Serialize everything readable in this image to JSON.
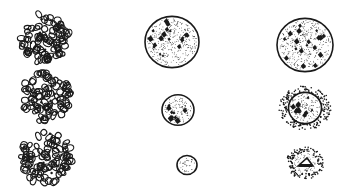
{
  "figure": {
    "type": "scientific-illustration",
    "background": "#ffffff",
    "ink": "#1a1a1a",
    "columns": [
      {
        "name": "reticulated-nuclei",
        "items": [
          {
            "cx": 45,
            "cy": 38,
            "r": 28,
            "style": "reticulate"
          },
          {
            "cx": 46,
            "cy": 97,
            "r": 28,
            "style": "reticulate"
          },
          {
            "cx": 46,
            "cy": 158,
            "r": 29,
            "style": "reticulate"
          }
        ]
      },
      {
        "name": "stippled-nuclei-with-chromatin",
        "items": [
          {
            "cx": 172,
            "cy": 42,
            "r": 27,
            "style": "stippled-blotched"
          },
          {
            "cx": 178,
            "cy": 110,
            "r": 16,
            "style": "stippled-blotched"
          },
          {
            "cx": 187,
            "cy": 165,
            "r": 10,
            "style": "stippled"
          }
        ]
      },
      {
        "name": "degenerating-nuclei",
        "items": [
          {
            "cx": 305,
            "cy": 45,
            "r": 28,
            "style": "stippled-outlined"
          },
          {
            "cx": 305,
            "cy": 108,
            "r": 22,
            "style": "stippled-halo"
          },
          {
            "cx": 305,
            "cy": 163,
            "r": 16,
            "style": "stippled-halo-small"
          }
        ]
      }
    ]
  }
}
